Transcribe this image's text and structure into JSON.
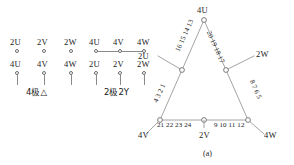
{
  "figure": {
    "caption": "(a)"
  },
  "left_diagrams": [
    {
      "name": "4-pole-delta",
      "caption": "4极△",
      "top_terminals": [
        "2U",
        "2V",
        "2W"
      ],
      "bottom_terminals": [
        "4U",
        "4V",
        "4W"
      ],
      "bridged_top": false
    },
    {
      "name": "2-pole-2Y",
      "caption": "2极2Y",
      "top_terminals": [
        "4U",
        "4V",
        "4W"
      ],
      "bottom_terminals": [
        "2U",
        "2V",
        "2W"
      ],
      "bridged_top": true
    }
  ],
  "triangle": {
    "vertices": {
      "top": "4U",
      "bottom_left": "4V",
      "bottom_right": "4W"
    },
    "taps": {
      "left_outer": "2U",
      "right_outer": "2W",
      "bottom_center": "2V"
    },
    "edge_numbers": {
      "upper_left": "16 15 14 13",
      "lower_left": "4 3 2 1",
      "upper_right": "20 19 18 17",
      "lower_right": "8 7 6 5",
      "bottom_left": "21 22 23 24",
      "bottom_right": "9 10 11 12"
    }
  }
}
